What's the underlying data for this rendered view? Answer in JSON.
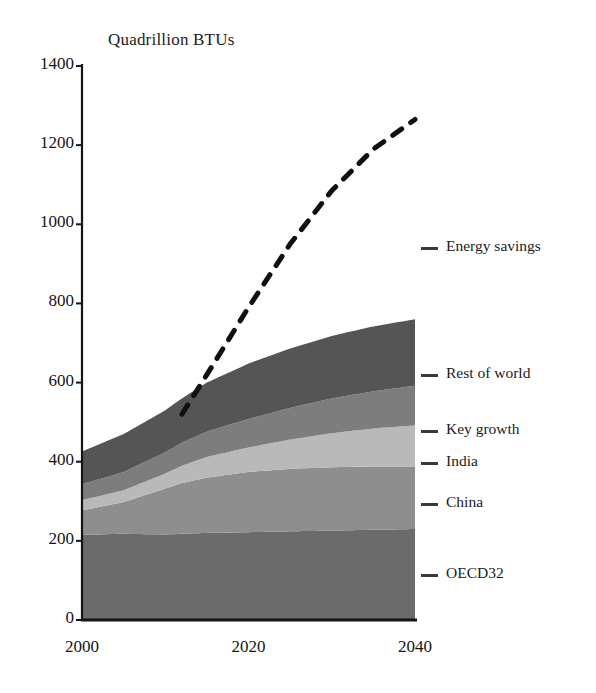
{
  "chart_data": {
    "type": "area",
    "title": "Quadrillion BTUs",
    "subtitle": "",
    "xlabel": "",
    "ylabel": "",
    "stacked": true,
    "grid": false,
    "legend_position": "right",
    "xlim": [
      2000,
      2040
    ],
    "ylim": [
      0,
      1400
    ],
    "xticks": [
      "2000",
      "2020",
      "2040"
    ],
    "xtick_values": [
      2000,
      2020,
      2040
    ],
    "yticks": [
      "0",
      "200",
      "400",
      "600",
      "800",
      "1000",
      "1200",
      "1400"
    ],
    "ytick_values": [
      0,
      200,
      400,
      600,
      800,
      1000,
      1200,
      1400
    ],
    "x": [
      2000,
      2005,
      2010,
      2012,
      2015,
      2020,
      2025,
      2030,
      2035,
      2040
    ],
    "series": [
      {
        "name": "OECD32",
        "color": "#6b6b6b",
        "values": [
          215,
          218,
          216,
          218,
          220,
          222,
          224,
          226,
          228,
          230
        ]
      },
      {
        "name": "China",
        "color": "#8e8e8e",
        "values": [
          62,
          80,
          116,
          128,
          140,
          152,
          158,
          160,
          160,
          158
        ]
      },
      {
        "name": "India",
        "color": "#b9b9b9",
        "values": [
          26,
          30,
          38,
          44,
          52,
          62,
          74,
          86,
          96,
          104
        ]
      },
      {
        "name": "Key growth",
        "color": "#7d7d7d",
        "values": [
          40,
          46,
          54,
          58,
          64,
          72,
          80,
          88,
          94,
          100
        ]
      },
      {
        "name": "Rest of world",
        "color": "#555555",
        "values": [
          83,
          96,
          106,
          112,
          124,
          140,
          150,
          158,
          164,
          168
        ]
      }
    ],
    "annotation_line": {
      "name": "Energy savings",
      "style": "dashed",
      "color": "#101010",
      "x": [
        2012,
        2015,
        2020,
        2025,
        2030,
        2035,
        2040
      ],
      "values": [
        520,
        620,
        790,
        950,
        1085,
        1190,
        1265
      ]
    },
    "totals": [
      426,
      470,
      530,
      560,
      600,
      648,
      686,
      718,
      742,
      760
    ]
  },
  "legend": {
    "items": [
      {
        "label": "Energy savings",
        "color": "#101010",
        "y": 248
      },
      {
        "label": "Rest of world",
        "color": "#555555",
        "y": 375
      },
      {
        "label": "Key growth",
        "color": "#7d7d7d",
        "y": 431
      },
      {
        "label": "India",
        "color": "#b9b9b9",
        "y": 463
      },
      {
        "label": "China",
        "color": "#8e8e8e",
        "y": 504
      },
      {
        "label": "OECD32",
        "color": "#6b6b6b",
        "y": 575
      }
    ]
  }
}
